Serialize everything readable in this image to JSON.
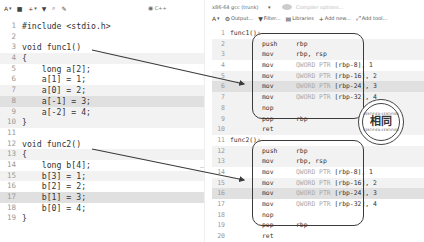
{
  "left_toolbar": {
    "items": [
      {
        "icon": "font-size-icon",
        "glyph": "A",
        "label": "▾"
      },
      {
        "icon": "save-icon",
        "glyph": "■",
        "label": ""
      },
      {
        "icon": "add-icon",
        "glyph": "+",
        "label": "▾"
      },
      {
        "icon": "vim-icon",
        "glyph": "▼",
        "label": ""
      },
      {
        "icon": "search-icon",
        "glyph": "⌕",
        "label": ""
      },
      {
        "icon": "pin-icon",
        "glyph": "✎",
        "label": ""
      }
    ],
    "language": {
      "icon": "cpp-icon",
      "glyph": "◉",
      "label": "C++"
    }
  },
  "right_toolbar": {
    "compiler": "x86-64 gcc (trunk)",
    "compiler_caret": "▾",
    "options_placeholder": "Compiler options...",
    "items": [
      {
        "icon": "font-size-icon",
        "glyph": "A",
        "label": "▾"
      },
      {
        "icon": "output-icon",
        "glyph": "⚙",
        "label": "Output..."
      },
      {
        "icon": "filter-icon",
        "glyph": "▼",
        "label": "Filter..."
      },
      {
        "icon": "libraries-icon",
        "glyph": "▤",
        "label": "Libraries"
      },
      {
        "icon": "add-new-icon",
        "glyph": "+",
        "label": "Add new..."
      },
      {
        "icon": "add-tool-icon",
        "glyph": "⤢",
        "label": "Add tool..."
      }
    ]
  },
  "source": {
    "lines": [
      {
        "n": "1",
        "text": "#include <stdio.h>",
        "hl": ""
      },
      {
        "n": "2",
        "text": "",
        "hl": ""
      },
      {
        "n": "3",
        "text": "void func1()",
        "hl": ""
      },
      {
        "n": "4",
        "text": "{",
        "hl": "hl1"
      },
      {
        "n": "5",
        "text": "    long a[2];",
        "hl": ""
      },
      {
        "n": "6",
        "text": "    a[1] = 1;",
        "hl": ""
      },
      {
        "n": "7",
        "text": "    a[0] = 2;",
        "hl": "hl1"
      },
      {
        "n": "8",
        "text": "    a[-1] = 3;",
        "hl": "hl2"
      },
      {
        "n": "9",
        "text": "    a[-2] = 4;",
        "hl": "hl1"
      },
      {
        "n": "10",
        "text": "}",
        "hl": "hl1"
      },
      {
        "n": "11",
        "text": "",
        "hl": ""
      },
      {
        "n": "12",
        "text": "void func2()",
        "hl": ""
      },
      {
        "n": "13",
        "text": "{",
        "hl": "hl1"
      },
      {
        "n": "14",
        "text": "    long b[4];",
        "hl": ""
      },
      {
        "n": "15",
        "text": "    b[3] = 1;",
        "hl": "hl1"
      },
      {
        "n": "16",
        "text": "    b[2] = 2;",
        "hl": ""
      },
      {
        "n": "17",
        "text": "    b[1] = 3;",
        "hl": "hl2"
      },
      {
        "n": "18",
        "text": "    b[0] = 4;",
        "hl": ""
      },
      {
        "n": "19",
        "text": "}",
        "hl": ""
      }
    ]
  },
  "assembly": {
    "lines": [
      {
        "n": "1",
        "label": "func1():",
        "op": "",
        "kw": "",
        "arg": "",
        "hl": ""
      },
      {
        "n": "2",
        "label": "",
        "op": "push",
        "kw": "",
        "arg": "rbp",
        "hl": "hl1"
      },
      {
        "n": "3",
        "label": "",
        "op": "mov",
        "kw": "",
        "arg": "rbp, rsp",
        "hl": "hl1"
      },
      {
        "n": "4",
        "label": "",
        "op": "mov",
        "kw": "QWORD PTR ",
        "arg": "[rbp-8], 1",
        "hl": ""
      },
      {
        "n": "5",
        "label": "",
        "op": "mov",
        "kw": "QWORD PTR ",
        "arg": "[rbp-16], 2",
        "hl": "hl1"
      },
      {
        "n": "6",
        "label": "",
        "op": "mov",
        "kw": "QWORD PTR ",
        "arg": "[rbp-24], 3",
        "hl": "hl2"
      },
      {
        "n": "7",
        "label": "",
        "op": "mov",
        "kw": "QWORD PTR ",
        "arg": "[rbp-32], 4",
        "hl": "hl1"
      },
      {
        "n": "8",
        "label": "",
        "op": "nop",
        "kw": "",
        "arg": "",
        "hl": "hl1"
      },
      {
        "n": "9",
        "label": "",
        "op": "pop",
        "kw": "",
        "arg": "rbp",
        "hl": "hl1"
      },
      {
        "n": "10",
        "label": "",
        "op": "ret",
        "kw": "",
        "arg": "",
        "hl": "hl1"
      },
      {
        "n": "11",
        "label": "func2():",
        "op": "",
        "kw": "",
        "arg": "",
        "hl": ""
      },
      {
        "n": "12",
        "label": "",
        "op": "push",
        "kw": "",
        "arg": "rbp",
        "hl": "hl1"
      },
      {
        "n": "13",
        "label": "",
        "op": "mov",
        "kw": "",
        "arg": "rbp, rsp",
        "hl": "hl1"
      },
      {
        "n": "14",
        "label": "",
        "op": "mov",
        "kw": "QWORD PTR ",
        "arg": "[rbp-8], 1",
        "hl": ""
      },
      {
        "n": "15",
        "label": "",
        "op": "mov",
        "kw": "QWORD PTR ",
        "arg": "[rbp-16], 2",
        "hl": "hl1"
      },
      {
        "n": "16",
        "label": "",
        "op": "mov",
        "kw": "QWORD PTR ",
        "arg": "[rbp-24], 3",
        "hl": "hl2"
      },
      {
        "n": "17",
        "label": "",
        "op": "mov",
        "kw": "QWORD PTR ",
        "arg": "[rbp-32], 4",
        "hl": ""
      },
      {
        "n": "18",
        "label": "",
        "op": "nop",
        "kw": "",
        "arg": "",
        "hl": ""
      },
      {
        "n": "19",
        "label": "",
        "op": "pop",
        "kw": "",
        "arg": "rbp",
        "hl": ""
      },
      {
        "n": "20",
        "label": "",
        "op": "ret",
        "kw": "",
        "arg": "",
        "hl": ""
      },
      {
        "n": "21",
        "label": ".LC0:",
        "op": "",
        "kw": "",
        "arg": "",
        "hl": ""
      }
    ]
  },
  "stamp": {
    "top_text": "CERTIFIED CERTIFIED",
    "main_text": "相同",
    "bottom_text": "CERTIFIED CERTIFIED"
  },
  "gutter_mark": "–",
  "colors": {
    "highlight_light": "#f2f2f2",
    "highlight_dark": "#e0e0e0",
    "annotation": "#3a3a3a"
  }
}
